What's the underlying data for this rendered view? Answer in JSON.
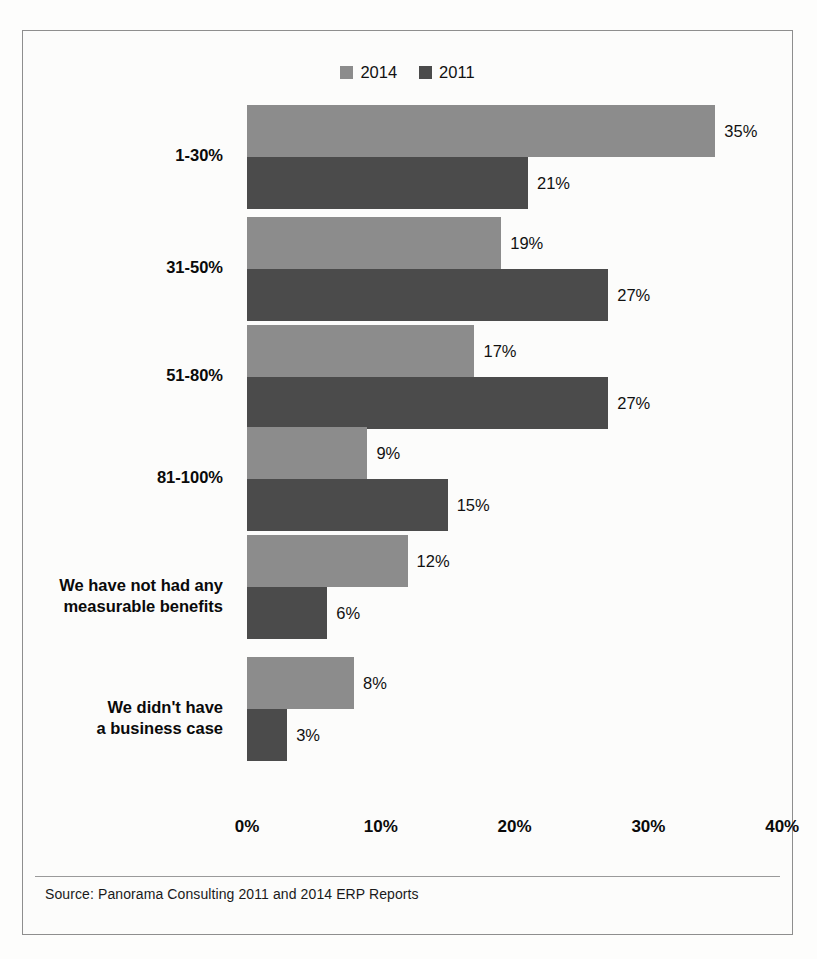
{
  "top_sliver_text": "cut-off text line",
  "legend": {
    "position": "top-center",
    "entries": [
      {
        "label": "2014",
        "color": "#8c8c8c"
      },
      {
        "label": "2011",
        "color": "#4b4b4b"
      }
    ]
  },
  "source": {
    "text": "Source: Panorama  Consulting 2011 and 2014  ERP Reports"
  },
  "chart_data": {
    "type": "bar",
    "orientation": "horizontal",
    "title": "",
    "subtitle": "",
    "xlabel": "",
    "ylabel": "",
    "xlim": [
      0,
      40
    ],
    "grid": false,
    "legend_position": "top-center",
    "tick_labels": [
      "0%",
      "10%",
      "20%",
      "30%",
      "40%"
    ],
    "tick_values": [
      0,
      10,
      20,
      30,
      40
    ],
    "categories": [
      "1-30%",
      "31-50%",
      "51-80%",
      "81-100%",
      "We have not had any\nmeasurable benefits",
      "We didn't have\na business case"
    ],
    "series": [
      {
        "name": "2014",
        "color": "#8c8c8c",
        "values": [
          35,
          19,
          17,
          9,
          12,
          8
        ],
        "value_labels": [
          "35%",
          "19%",
          "17%",
          "9%",
          "12%",
          "8%"
        ]
      },
      {
        "name": "2011",
        "color": "#4b4b4b",
        "values": [
          21,
          27,
          27,
          15,
          6,
          3
        ],
        "value_labels": [
          "21%",
          "27%",
          "27%",
          "15%",
          "6%",
          "3%"
        ]
      }
    ]
  }
}
